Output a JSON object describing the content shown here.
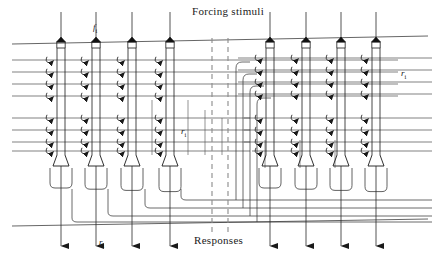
{
  "figure": {
    "type": "diagram",
    "title_top": "Forcing stimuli",
    "title_bottom": "Responses",
    "background_color": "#ffffff",
    "line_color": "#1a1a1a",
    "dashed_color": "#8a8a8a",
    "width": 439,
    "height": 260
  },
  "labels": {
    "forcing_stimuli": "Forcing stimuli",
    "responses": "Responses",
    "stimulus_symbol": "f",
    "stimulus_subscript": "i",
    "response_symbol": "r",
    "response_subscript": "i"
  },
  "annotations": [
    {
      "name": "stimulus-label-fi",
      "text": "f",
      "sub": "i",
      "x": 93,
      "y": 22
    },
    {
      "name": "response-label-ri-mid",
      "text": "r",
      "sub": "i",
      "x": 181,
      "y": 126
    },
    {
      "name": "response-label-ri-right",
      "text": "r",
      "sub": "i",
      "x": 401,
      "y": 68
    },
    {
      "name": "response-label-ri-bottom",
      "text": "r",
      "sub": "i",
      "x": 99,
      "y": 237
    }
  ],
  "groups": [
    {
      "name": "left-group",
      "neuron_x": [
        61,
        96,
        132,
        170
      ]
    },
    {
      "name": "right-group",
      "neuron_x": [
        270,
        306,
        341,
        376
      ]
    }
  ],
  "neuron": {
    "top_cap_y": 42,
    "body_top_y": 48,
    "body_bottom_y": 155,
    "body_half_width": 4,
    "foot_half_width": 8,
    "foot_y": 166,
    "axon_arrow_y": 246
  },
  "dashed_separators": {
    "x": [
      212,
      228
    ],
    "y1": 38,
    "y2": 232
  },
  "boundary_lines": {
    "top": {
      "x1": 12,
      "y1": 44,
      "x2": 428,
      "y2": 36
    },
    "bottom": {
      "x1": 12,
      "y1": 226,
      "x2": 428,
      "y2": 219
    }
  },
  "synapse_rows_left_y": [
    60,
    72,
    84,
    96,
    118,
    130,
    142,
    151
  ],
  "synapse_rows_right_y": [
    58,
    70,
    82,
    94,
    118,
    130,
    142,
    151
  ],
  "feedback_loops": {
    "bottom_y": [
      188,
      190,
      192,
      194
    ],
    "return_y": [
      200,
      208,
      216,
      222
    ]
  },
  "counts": {
    "neurons_total": 8,
    "neurons_per_group": 4,
    "synapses_per_neuron": 8
  }
}
